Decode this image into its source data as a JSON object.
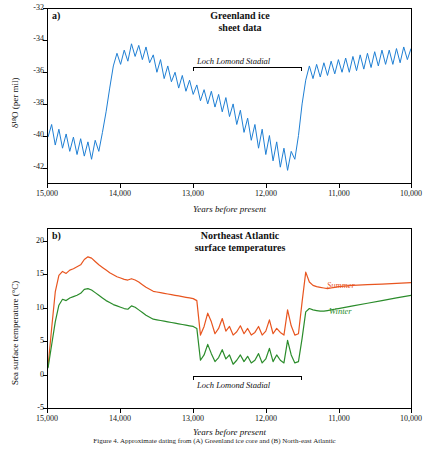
{
  "caption": "Figure 4. Approximate dating from (A) Greenland ice core and (B) North-east Atlantic",
  "panelA": {
    "letter": "a)",
    "title_line1": "Greenland ice",
    "title_line2": "sheet data",
    "ylabel": "δ¹⁸O (per mil)",
    "xlabel": "Years before present",
    "stadial_label": "Loch Lomond Stadial",
    "xticks": [
      "15,000",
      "14,000",
      "13,000",
      "12,000",
      "11,000",
      "10,000"
    ],
    "yticks": [
      "-32",
      "-34",
      "-36",
      "-38",
      "-40",
      "-42"
    ]
  },
  "panelB": {
    "letter": "b)",
    "title_line1": "Northeast Atlantic",
    "title_line2": "surface temperatures",
    "ylabel": "Sea surface temperature (°C)",
    "xlabel": "Years before present",
    "stadial_label": "Loch Lomond Stadial",
    "summer_label": "Summer",
    "winter_label": "Winter",
    "xticks": [
      "15,000",
      "14,000",
      "13,000",
      "12,000",
      "11,000",
      "10,000"
    ],
    "yticks": [
      "20",
      "15",
      "10",
      "5",
      "0",
      "-5"
    ]
  },
  "colors": {
    "ice": "#1f7fd4",
    "summer": "#e8551f",
    "winter": "#2b8c2b",
    "axis": "#000000"
  },
  "chart_data": [
    {
      "type": "line",
      "title": "Greenland ice sheet data",
      "xlabel": "Years before present",
      "ylabel": "δ¹⁸O (per mil)",
      "xlim": [
        15000,
        10000
      ],
      "ylim": [
        -43,
        -32
      ],
      "xticks": [
        15000,
        14000,
        13000,
        12000,
        11000,
        10000
      ],
      "yticks": [
        -32,
        -34,
        -36,
        -38,
        -40,
        -42
      ],
      "grid": false,
      "legend": "none",
      "annotations": [
        {
          "text": "Loch Lomond Stadial",
          "x_start": 12950,
          "x_end": 11550,
          "y": -35.0
        }
      ],
      "series": [
        {
          "name": "δ¹⁸O",
          "color": "#1f7fd4",
          "x": [
            15000,
            14950,
            14900,
            14850,
            14800,
            14750,
            14700,
            14650,
            14600,
            14550,
            14500,
            14450,
            14400,
            14350,
            14300,
            14250,
            14200,
            14150,
            14100,
            14050,
            14000,
            13950,
            13900,
            13850,
            13800,
            13750,
            13700,
            13650,
            13600,
            13550,
            13500,
            13450,
            13400,
            13350,
            13300,
            13250,
            13200,
            13150,
            13100,
            13050,
            13000,
            12950,
            12900,
            12850,
            12800,
            12750,
            12700,
            12650,
            12600,
            12550,
            12500,
            12450,
            12400,
            12350,
            12300,
            12250,
            12200,
            12150,
            12100,
            12050,
            12000,
            11950,
            11900,
            11850,
            11800,
            11750,
            11700,
            11650,
            11600,
            11550,
            11500,
            11450,
            11400,
            11350,
            11300,
            11250,
            11200,
            11150,
            11100,
            11050,
            11000,
            10950,
            10900,
            10850,
            10800,
            10750,
            10700,
            10650,
            10600,
            10550,
            10500,
            10450,
            10400,
            10350,
            10300,
            10250,
            10200,
            10150,
            10100,
            10050,
            10000
          ],
          "y": [
            -40.1,
            -39.3,
            -40.6,
            -39.6,
            -40.8,
            -39.9,
            -41.0,
            -40.1,
            -41.2,
            -40.2,
            -41.3,
            -40.4,
            -41.5,
            -40.3,
            -41.0,
            -39.8,
            -38.5,
            -37.0,
            -35.6,
            -34.8,
            -35.5,
            -34.6,
            -35.3,
            -34.2,
            -35.0,
            -34.3,
            -35.2,
            -34.4,
            -35.4,
            -34.9,
            -36.0,
            -35.2,
            -36.4,
            -35.6,
            -36.6,
            -36.0,
            -37.0,
            -36.2,
            -37.2,
            -36.5,
            -37.4,
            -36.8,
            -37.8,
            -37.1,
            -38.0,
            -37.2,
            -38.2,
            -37.4,
            -38.5,
            -37.6,
            -38.8,
            -38.0,
            -39.3,
            -38.4,
            -39.8,
            -38.9,
            -40.3,
            -39.3,
            -40.8,
            -39.6,
            -41.2,
            -40.0,
            -41.6,
            -40.4,
            -42.0,
            -40.8,
            -42.2,
            -41.0,
            -41.5,
            -40.0,
            -38.0,
            -36.5,
            -35.6,
            -36.4,
            -35.5,
            -36.3,
            -35.4,
            -36.2,
            -35.3,
            -36.1,
            -35.2,
            -36.0,
            -35.1,
            -36.0,
            -35.0,
            -35.9,
            -34.9,
            -35.8,
            -34.8,
            -35.7,
            -34.7,
            -35.6,
            -34.6,
            -35.5,
            -34.6,
            -35.5,
            -34.5,
            -35.4,
            -34.4,
            -35.2,
            -34.5
          ]
        }
      ]
    },
    {
      "type": "line",
      "title": "Northeast Atlantic surface temperatures",
      "xlabel": "Years before present",
      "ylabel": "Sea surface temperature (°C)",
      "xlim": [
        15000,
        10000
      ],
      "ylim": [
        -6,
        21
      ],
      "xticks": [
        15000,
        14000,
        13000,
        12000,
        11000,
        10000
      ],
      "yticks": [
        20,
        15,
        10,
        5,
        0,
        -5
      ],
      "grid": false,
      "legend": "inline",
      "annotations": [
        {
          "text": "Loch Lomond Stadial",
          "x_start": 12950,
          "x_end": 11550,
          "y": 0.5
        }
      ],
      "series": [
        {
          "name": "Summer",
          "color": "#e8551f",
          "x": [
            15000,
            14950,
            14900,
            14850,
            14800,
            14750,
            14700,
            14650,
            14600,
            14550,
            14500,
            14450,
            14400,
            14350,
            14300,
            14250,
            14200,
            14150,
            14100,
            14050,
            14000,
            13950,
            13900,
            13850,
            13800,
            13750,
            13700,
            13650,
            13600,
            13550,
            13500,
            13450,
            13400,
            13350,
            13300,
            13250,
            13200,
            13150,
            13100,
            13050,
            13000,
            12950,
            12900,
            12850,
            12800,
            12750,
            12700,
            12650,
            12600,
            12550,
            12500,
            12450,
            12400,
            12350,
            12300,
            12250,
            12200,
            12150,
            12100,
            12050,
            12000,
            11950,
            11900,
            11850,
            11800,
            11750,
            11700,
            11650,
            11600,
            11550,
            11500,
            11450,
            11400,
            11350,
            11300,
            11250,
            11200,
            11150,
            11100,
            11050,
            11000,
            10800,
            10600,
            10400,
            10200,
            10000
          ],
          "y": [
            0.2,
            6.0,
            11.5,
            14.0,
            14.6,
            14.3,
            14.8,
            15.0,
            15.3,
            15.6,
            16.4,
            16.8,
            16.6,
            16.1,
            15.6,
            15.2,
            14.8,
            14.4,
            14.1,
            13.8,
            13.6,
            13.4,
            13.3,
            13.5,
            13.3,
            13.0,
            12.6,
            12.2,
            11.9,
            11.6,
            11.5,
            11.4,
            11.3,
            11.2,
            11.1,
            11.0,
            10.9,
            10.8,
            10.7,
            10.6,
            10.5,
            10.2,
            5.0,
            6.3,
            8.3,
            7.0,
            5.2,
            6.0,
            7.5,
            5.6,
            6.3,
            5.0,
            5.5,
            6.4,
            5.2,
            6.0,
            5.0,
            5.4,
            6.3,
            5.0,
            5.6,
            7.3,
            5.2,
            6.0,
            5.4,
            5.0,
            8.8,
            6.4,
            5.0,
            5.2,
            10.0,
            14.5,
            13.0,
            12.5,
            12.3,
            12.2,
            12.1,
            12.0,
            12.1,
            12.2,
            12.3,
            12.5,
            12.6,
            12.7,
            12.8,
            12.9
          ]
        },
        {
          "name": "Winter",
          "color": "#2b8c2b",
          "x": [
            15000,
            14950,
            14900,
            14850,
            14800,
            14750,
            14700,
            14650,
            14600,
            14550,
            14500,
            14450,
            14400,
            14350,
            14300,
            14250,
            14200,
            14150,
            14100,
            14050,
            14000,
            13950,
            13900,
            13850,
            13800,
            13750,
            13700,
            13650,
            13600,
            13550,
            13500,
            13450,
            13400,
            13350,
            13300,
            13250,
            13200,
            13150,
            13100,
            13050,
            13000,
            12950,
            12900,
            12850,
            12800,
            12750,
            12700,
            12650,
            12600,
            12550,
            12500,
            12450,
            12400,
            12350,
            12300,
            12250,
            12200,
            12150,
            12100,
            12050,
            12000,
            11950,
            11900,
            11850,
            11800,
            11750,
            11700,
            11650,
            11600,
            11550,
            11500,
            11450,
            11400,
            11350,
            11300,
            11250,
            11200,
            11150,
            11100,
            11050,
            11000,
            10800,
            10600,
            10400,
            10200,
            10000
          ],
          "y": [
            0.0,
            3.5,
            7.0,
            9.5,
            10.4,
            10.2,
            10.6,
            10.8,
            11.0,
            11.3,
            11.9,
            12.0,
            11.8,
            11.4,
            11.0,
            10.6,
            10.2,
            9.9,
            9.6,
            9.4,
            9.2,
            9.0,
            8.9,
            9.4,
            9.2,
            8.8,
            8.4,
            8.0,
            7.7,
            7.4,
            7.3,
            7.2,
            7.1,
            7.0,
            6.9,
            6.8,
            6.7,
            6.6,
            6.5,
            6.4,
            6.3,
            6.0,
            1.2,
            2.0,
            3.6,
            2.2,
            1.0,
            1.6,
            2.8,
            1.4,
            2.0,
            0.6,
            1.2,
            2.0,
            1.0,
            1.8,
            0.8,
            1.2,
            2.2,
            0.8,
            1.4,
            3.0,
            1.0,
            2.0,
            1.2,
            0.8,
            4.2,
            2.0,
            0.8,
            1.0,
            4.5,
            8.5,
            9.0,
            8.8,
            8.7,
            8.6,
            8.6,
            8.7,
            8.8,
            8.9,
            9.0,
            9.4,
            9.8,
            10.2,
            10.6,
            11.0
          ]
        }
      ]
    }
  ]
}
